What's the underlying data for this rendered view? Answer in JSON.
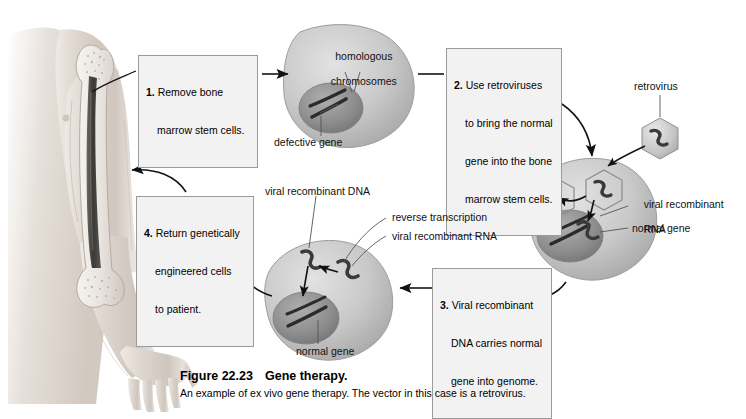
{
  "figure": {
    "number": "Figure 22.23",
    "title": "Gene therapy.",
    "description": "An example of ex vivo gene therapy. The vector in this case is a retrovirus."
  },
  "steps": [
    {
      "id": "step-1",
      "number": "1.",
      "lines": [
        "Remove bone",
        "marrow stem cells."
      ],
      "text": "1. Remove bone marrow stem cells."
    },
    {
      "id": "step-2",
      "number": "2.",
      "lines": [
        "Use retroviruses",
        "to bring the normal",
        "gene into the bone",
        "marrow stem cells."
      ],
      "text": "2. Use retroviruses to bring the normal gene into the bone marrow stem cells."
    },
    {
      "id": "step-3",
      "number": "3.",
      "lines": [
        "Viral recombinant",
        "DNA carries normal",
        "gene into genome."
      ],
      "text": "3. Viral recombinant DNA carries normal gene into genome."
    },
    {
      "id": "step-4",
      "number": "4.",
      "lines": [
        "Return genetically",
        "engineered cells",
        "to patient."
      ],
      "text": "4. Return genetically engineered cells to patient."
    }
  ],
  "labels": {
    "homologous_chromosomes_line1": "homologous",
    "homologous_chromosomes_line2": "chromosomes",
    "defective_gene": "defective gene",
    "retrovirus": "retrovirus",
    "viral_recombinant_rna_right_line1": "viral recombinant",
    "viral_recombinant_rna_right_line2": "RNA",
    "normal_gene_right": "normal gene",
    "viral_recombinant_dna": "viral recombinant DNA",
    "reverse_transcription": "reverse transcription",
    "viral_recombinant_rna": "viral recombinant RNA",
    "normal_gene_bottom": "normal gene"
  },
  "anatomy": {
    "arm": "human arm with humerus bone and marrow cavity",
    "cells": [
      "bone marrow stem cell with defective gene",
      "stem cell infected by retrovirus",
      "genetically engineered stem cell with normal gene"
    ]
  },
  "colors": {
    "box_fill": "#f2f2f2",
    "box_border": "#9a9a9a",
    "text": "#000000",
    "cell_body": "#c9c9c9",
    "nucleus": "#9a9a9a",
    "arrow": "#111111",
    "skin": "#d8d2cc"
  }
}
